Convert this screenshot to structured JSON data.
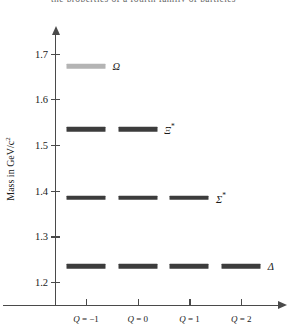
{
  "top_caption": "the properties of a fourth family of particles",
  "chart_data": {
    "type": "scatter",
    "title": "",
    "xlabel": "",
    "ylabel": "Mass in GeV/c",
    "ylabel_sup": "2",
    "ylim": [
      1.15,
      1.745
    ],
    "xlim": [
      -1.6,
      2.75
    ],
    "grid": false,
    "legend": "none",
    "y_ticks": [
      1.2,
      1.3,
      1.4,
      1.5,
      1.6,
      1.7
    ],
    "y_tick_labels": [
      "1.2",
      "1.3",
      "1.4",
      "1.5",
      "1.6",
      "1.7"
    ],
    "x_ticks": [
      -1,
      0,
      1,
      2
    ],
    "x_tick_labels": [
      "Q = -1",
      "Q = 0",
      "Q = 1",
      "Q = 2"
    ],
    "x_tick_symbols": [
      "Q",
      "Q",
      "Q",
      "Q"
    ],
    "x_tick_values": [
      "= −1",
      "= 0",
      "= 1",
      "= 2"
    ],
    "series": [
      {
        "name": "Ω",
        "label": "Ω",
        "label_sup": "",
        "mass": 1.672,
        "charges": [
          -1
        ],
        "color": "#b4b4b4"
      },
      {
        "name": "Ξ*",
        "label": "Ξ",
        "label_sup": "*",
        "mass": 1.535,
        "charges": [
          -1,
          0
        ],
        "color": "#3c3c3c"
      },
      {
        "name": "Σ*",
        "label": "Σ",
        "label_sup": "*",
        "mass": 1.385,
        "charges": [
          -1,
          0,
          1
        ],
        "color": "#3c3c3c"
      },
      {
        "name": "Δ",
        "label": "Δ",
        "label_sup": "",
        "mass": 1.235,
        "charges": [
          -1,
          0,
          1,
          2
        ],
        "color": "#3c3c3c"
      }
    ]
  }
}
